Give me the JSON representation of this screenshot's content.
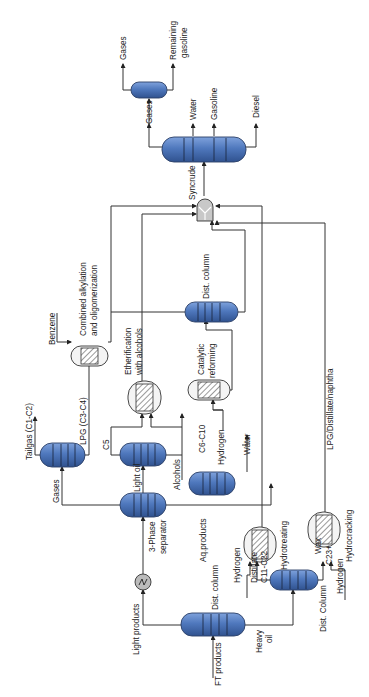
{
  "diagram": {
    "orientation": "rotated-90-ccw",
    "colors": {
      "column_fill": "#5079bd",
      "column_stroke": "#2b3f66",
      "line": "#333333",
      "reactor_fill": "#f4f4f4"
    },
    "units": {
      "dist_column_main": "Dist. column",
      "three_phase_separator": "3-Phase\nseparator",
      "light_oil_column": "Light oil",
      "gas_column": "",
      "aq_column": "",
      "dist_column_heavy": "Dist. Column",
      "hydrotreating": "Hydrotreating",
      "hydrocracking": "Hydrocracking",
      "etherification_l1": "Etherification",
      "etherification_l2": "with alcohols",
      "catalytic_reforming_l1": "Catalytic",
      "catalytic_reforming_l2": "reforming",
      "alkylation_l1": "Combined alkylation",
      "alkylation_l2": "and oligomerization",
      "dist_column_reformate": "Dist. column",
      "syncrude_mixer": "Syncrude",
      "final_column": "",
      "gas_splitter": ""
    },
    "streams": {
      "ft_products": "FT products",
      "light_products": "Light products",
      "heavy_oil_l1": "Heavy",
      "heavy_oil_l2": "oil",
      "three_phase_l1": "3-Phase",
      "three_phase_l2": "separator",
      "aq_products": "Aq.products",
      "gases": "Gases",
      "tailgas": "Tailgas (C1-C2)",
      "lpg": "LPG (C3-C4)",
      "light_oil": "Light oil",
      "c5": "C5",
      "alcohols": "Alcohols",
      "c6_c10": "C6-C10",
      "hydrogen_reforming": "Hydrogen",
      "water_aq": "Water",
      "benzene": "Benzene",
      "hydrogen_ht": "Hydrogen",
      "distillate": "Distillate",
      "c11_c22": "C11-C22",
      "wax": "Wax",
      "c23_plus": "C23+",
      "hydrogen_hc": "Hydrogen",
      "lpg_distillate_naphtha": "LPG/Distillate/naphtha",
      "dist_column_heavy": "Dist. Column",
      "out_gases": "Gases",
      "out_water": "Water",
      "out_gasoline": "Gasoline",
      "out_diesel": "Diesel",
      "split_gases": "Gases",
      "remaining_l1": "Remaining",
      "remaining_l2": "gasoline"
    }
  }
}
